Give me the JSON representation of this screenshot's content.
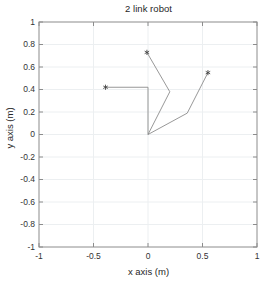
{
  "figure": {
    "title": "2 link robot",
    "xlabel": "x axis (m)",
    "ylabel": "y axis (m)",
    "background_color": "#ffffff",
    "axes_color": "#8c8c8c",
    "grid_color": "#eceff1",
    "line_color": "#8c8c8c",
    "marker_color": "#404040"
  },
  "chart_data": {
    "type": "line",
    "title": "2 link robot",
    "xlabel": "x axis (m)",
    "ylabel": "y axis (m)",
    "xlim": [
      -1,
      1
    ],
    "ylim": [
      -1,
      1
    ],
    "grid": true,
    "legend": "none",
    "xticks": [
      -1,
      -0.5,
      0,
      0.5,
      1
    ],
    "xtick_labels": [
      "-1",
      "-0.5",
      "0",
      "0.5",
      "1"
    ],
    "yticks": [
      -1,
      -0.8,
      -0.6,
      -0.4,
      -0.2,
      0,
      0.2,
      0.4,
      0.6,
      0.8,
      1
    ],
    "ytick_labels": [
      "-1",
      "-0.8",
      "-0.6",
      "-0.4",
      "-0.2",
      "0",
      "0.2",
      "0.4",
      "0.6",
      "0.8",
      "1"
    ],
    "xminor_gridlines": [
      -0.5,
      0,
      0.5
    ],
    "series": [
      {
        "name": "configuration-1",
        "marker": "*",
        "marker_at": "end",
        "x": [
          0.0,
          0.0,
          -0.39
        ],
        "y": [
          0.0,
          0.42,
          0.42
        ]
      },
      {
        "name": "configuration-2",
        "marker": "*",
        "marker_at": "end",
        "x": [
          0.0,
          0.2,
          -0.01
        ],
        "y": [
          0.0,
          0.38,
          0.73
        ]
      },
      {
        "name": "configuration-3",
        "marker": "*",
        "marker_at": "end",
        "x": [
          0.0,
          0.36,
          0.55
        ],
        "y": [
          0.0,
          0.19,
          0.55
        ]
      }
    ],
    "base_point": {
      "x": 0.0,
      "y": 0.0
    }
  }
}
